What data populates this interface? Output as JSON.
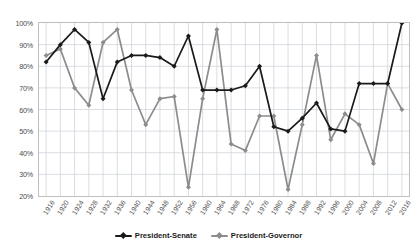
{
  "chart_data": {
    "type": "line",
    "title": "",
    "subtitle": "",
    "xlabel": "",
    "ylabel": "",
    "grid": true,
    "legend_position": "bottom",
    "ylim": [
      20,
      100
    ],
    "ytick_labels": [
      "20%",
      "30%",
      "40%",
      "50%",
      "60%",
      "70%",
      "80%",
      "90%",
      "100%"
    ],
    "ytick_values": [
      20,
      30,
      40,
      50,
      60,
      70,
      80,
      90,
      100
    ],
    "x": [
      1916,
      1920,
      1924,
      1928,
      1932,
      1936,
      1940,
      1944,
      1948,
      1952,
      1956,
      1960,
      1964,
      1968,
      1972,
      1976,
      1980,
      1984,
      1988,
      1992,
      1996,
      2000,
      2004,
      2008,
      2012,
      2016
    ],
    "categories": [
      "1916",
      "1920",
      "1924",
      "1928",
      "1932",
      "1936",
      "1940",
      "1944",
      "1948",
      "1952",
      "1956",
      "1960",
      "1964",
      "1968",
      "1972",
      "1976",
      "1980",
      "1984",
      "1988",
      "1992",
      "1996",
      "2000",
      "2004",
      "2008",
      "2012",
      "2016"
    ],
    "series": [
      {
        "name": "President-Senate",
        "color": "#1a1a1a",
        "marker": "diamond",
        "values": [
          82,
          90,
          97,
          91,
          65,
          82,
          85,
          85,
          84,
          80,
          94,
          69,
          69,
          69,
          71,
          80,
          52,
          50,
          56,
          63,
          51,
          50,
          72,
          72,
          72,
          100
        ]
      },
      {
        "name": "President-Governor",
        "color": "#8c8c8c",
        "marker": "diamond",
        "values": [
          85,
          88,
          70,
          62,
          91,
          97,
          69,
          53,
          65,
          66,
          24,
          65,
          97,
          44,
          41,
          57,
          57,
          23,
          53,
          85,
          46,
          58,
          53,
          35,
          72,
          60
        ]
      }
    ]
  }
}
